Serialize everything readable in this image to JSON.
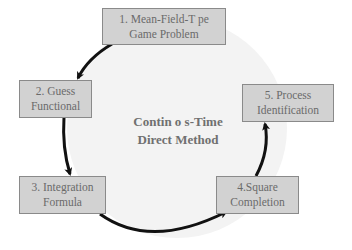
{
  "diagram": {
    "center": {
      "line1": "Contin o s-Time",
      "line2": "Direct Method"
    },
    "steps": [
      {
        "line1": "1. Mean-Field-T pe",
        "line2": "Game Problem"
      },
      {
        "line1": "2. Guess",
        "line2": "Functional"
      },
      {
        "line1": "3. Integration",
        "line2": "Formula"
      },
      {
        "line1": "4.Square",
        "line2": "Completion"
      },
      {
        "line1": "5. Process",
        "line2": "Identification"
      }
    ],
    "colors": {
      "circle_fill": "#f3f3f3",
      "box_fill": "#d2d2d2",
      "box_border": "#8a8a8a",
      "arrow": "#111111",
      "text": "#6a6a6a"
    }
  }
}
